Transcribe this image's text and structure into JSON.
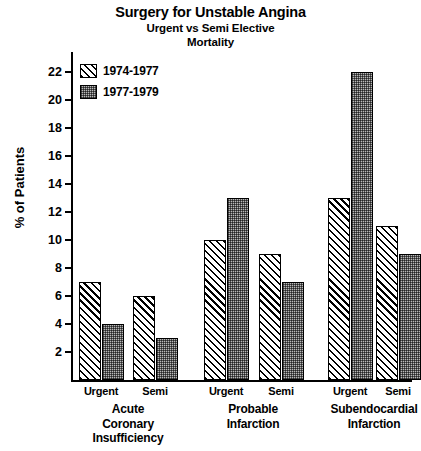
{
  "chart_data": {
    "type": "bar",
    "title": "Surgery for Unstable Angina",
    "subtitle1": "Urgent vs Semi Elective",
    "subtitle2": "Mortality",
    "xlabel": "",
    "ylabel": "% of Patients",
    "ylim": [
      0,
      23
    ],
    "ytick_step": 2,
    "yticks": [
      2,
      4,
      6,
      8,
      10,
      12,
      14,
      16,
      18,
      20,
      22
    ],
    "ytick_labels": [
      "2",
      "4",
      "6",
      "8",
      "10",
      "12",
      "14",
      "16",
      "18",
      "20",
      "22"
    ],
    "grid": false,
    "legend_position": "top-left",
    "legend": [
      "1974-1977",
      "1977-1979"
    ],
    "groups": [
      {
        "label_lines": [
          "Acute",
          "Coronary",
          "Insufficiency"
        ],
        "subgroups": [
          "Urgent",
          "Semi"
        ]
      },
      {
        "label_lines": [
          "Probable",
          "Infarction"
        ],
        "subgroups": [
          "Urgent",
          "Semi"
        ]
      },
      {
        "label_lines": [
          "Subendocardial",
          "Infarction"
        ],
        "subgroups": [
          "Urgent",
          "Semi"
        ]
      }
    ],
    "categories": [
      "Acute Coronary Insufficiency - Urgent",
      "Acute Coronary Insufficiency - Semi",
      "Probable Infarction - Urgent",
      "Probable Infarction - Semi",
      "Subendocardial Infarction - Urgent",
      "Subendocardial Infarction - Semi"
    ],
    "series": [
      {
        "name": "1974-1977",
        "values": [
          7,
          6,
          10,
          9,
          13,
          11
        ]
      },
      {
        "name": "1977-1979",
        "values": [
          4,
          3,
          13,
          7,
          22,
          9
        ]
      }
    ]
  }
}
